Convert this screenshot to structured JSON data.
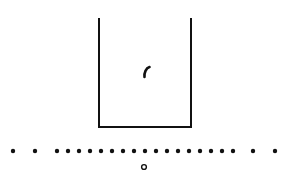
{
  "diagram": {
    "ink_color": "#111111",
    "background": "#ffffff",
    "container": {
      "left": 99,
      "right": 191,
      "top": 18,
      "bottom": 127,
      "open_top": true
    },
    "particle": {
      "x": 147,
      "y": 72,
      "shape": "comma-like curved stroke"
    },
    "row_of_dots": {
      "y": 151,
      "radius": 2.2,
      "x": [
        13,
        35,
        57,
        68,
        79,
        90,
        101,
        112,
        123,
        134,
        145,
        156,
        167,
        178,
        189,
        200,
        211,
        222,
        233,
        253,
        275
      ]
    },
    "open_circle": {
      "x": 144,
      "y": 167,
      "radius": 2.4
    }
  }
}
